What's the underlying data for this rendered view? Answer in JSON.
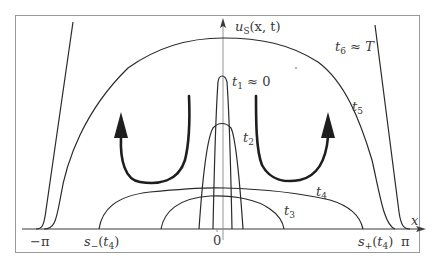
{
  "diagram": {
    "axes": {
      "y_label": "u",
      "y_label_sub": "S",
      "y_label_args": "(x, t)",
      "x_label": "x",
      "x_ticks": [
        {
          "label": "−π",
          "position": "left"
        },
        {
          "label": "0",
          "position": "center"
        },
        {
          "label": "π",
          "position": "right"
        }
      ]
    },
    "curve_labels": {
      "t1": {
        "name": "t",
        "sub": "1",
        "suffix": " ≈ 0"
      },
      "t2": {
        "name": "t",
        "sub": "2"
      },
      "t3": {
        "name": "t",
        "sub": "3"
      },
      "t4": {
        "name": "t",
        "sub": "4"
      },
      "t5": {
        "name": "t",
        "sub": "5"
      },
      "t6": {
        "name": "t",
        "sub": "6",
        "suffix": " ≈ T"
      }
    },
    "points": {
      "s_minus": {
        "name": "s",
        "sub": "−",
        "args_open": "(",
        "arg_name": "t",
        "arg_sub": "4",
        "args_close": ")"
      },
      "s_plus": {
        "name": "s",
        "sub": "+",
        "args_open": "(",
        "arg_name": "t",
        "arg_sub": "4",
        "args_close": ")"
      }
    },
    "arrows": [
      {
        "direction": "up",
        "side": "left",
        "meaning": "growth"
      },
      {
        "direction": "up",
        "side": "right",
        "meaning": "growth"
      }
    ],
    "colors": {
      "stroke": "#2a2a2a",
      "frame": "#9a9a9a",
      "background": "#ffffff"
    }
  }
}
